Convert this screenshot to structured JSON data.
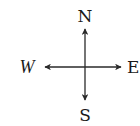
{
  "diagram": {
    "type": "compass-rose",
    "colors": {
      "stroke": "#2a2a2a",
      "text": "#1a1a1a",
      "background": "#ffffff"
    },
    "directions": {
      "north": {
        "label": "N",
        "icon": "arrow-up-icon"
      },
      "south": {
        "label": "S",
        "icon": "arrow-down-icon"
      },
      "west": {
        "label": "W",
        "icon": "arrow-left-icon"
      },
      "east": {
        "label": "E",
        "icon": "arrow-right-icon"
      }
    }
  }
}
